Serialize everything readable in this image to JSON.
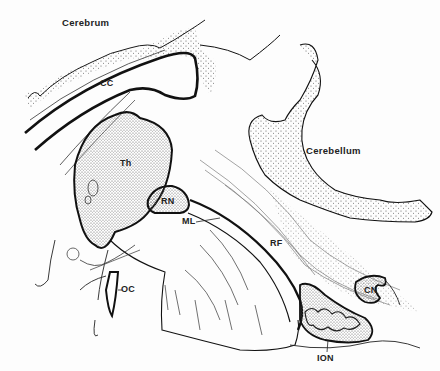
{
  "figure": {
    "type": "anatomical line drawing (sagittal section of brain)",
    "labels": {
      "cerebrum": "Cerebrum",
      "cerebellum": "Cerebellum",
      "cc": "CC",
      "th": "Th",
      "rn": "RN",
      "ml": "ML",
      "rf": "RF",
      "oc": "OC",
      "cn": "CN",
      "ion": "ION"
    },
    "colors": {
      "ink": "#1a1a1a",
      "stipple": "#555555",
      "background": "#fdfdfd"
    }
  }
}
